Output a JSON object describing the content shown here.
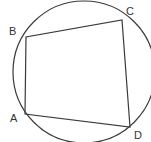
{
  "diagram": {
    "stroke_color": "#3a3a3a",
    "circle": {
      "cx": 84,
      "cy": 72,
      "r": 71
    },
    "points": [
      {
        "name": "A",
        "label": "A",
        "x": 25,
        "y": 114,
        "lx": 11,
        "ly": 121
      },
      {
        "name": "B",
        "label": "B",
        "x": 26,
        "y": 37,
        "lx": 9,
        "ly": 34
      },
      {
        "name": "C",
        "label": "C",
        "x": 122,
        "y": 20,
        "lx": 126,
        "ly": 14
      },
      {
        "name": "D",
        "label": "D",
        "x": 130,
        "y": 127,
        "lx": 135,
        "ly": 139
      }
    ]
  }
}
